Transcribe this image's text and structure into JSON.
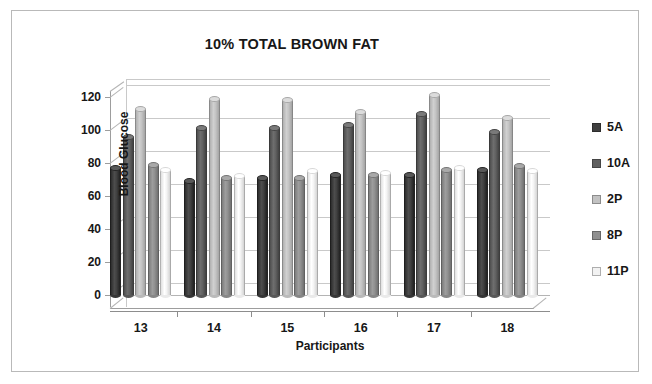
{
  "frame": {
    "border_color": "#b9b9b9",
    "background": "#ffffff"
  },
  "title": "10% TOTAL BROWN FAT",
  "axes": {
    "y_label": "Blood Glucose",
    "x_label": "Participants"
  },
  "legend": {
    "position": "right",
    "entries": [
      {
        "label": "5A",
        "color": "#3f3f3f"
      },
      {
        "label": "10A",
        "color": "#606060"
      },
      {
        "label": "2P",
        "color": "#c2c2c2"
      },
      {
        "label": "8P",
        "color": "#8f8f8f"
      },
      {
        "label": "11P",
        "color": "#f2f2f2"
      }
    ]
  },
  "chart_data": {
    "type": "bar",
    "title": "10% TOTAL BROWN FAT",
    "subtitle": "",
    "xlabel": "Participants",
    "ylabel": "Blood Glucose",
    "categories": [
      "13",
      "14",
      "15",
      "16",
      "17",
      "18"
    ],
    "ylim": [
      0,
      120
    ],
    "yticks": [
      0,
      20,
      40,
      60,
      80,
      100,
      120
    ],
    "grid": true,
    "legend_position": "right",
    "style": "3d-cylinder",
    "series": [
      {
        "name": "5A",
        "color": "#3f3f3f",
        "values": [
          77,
          69,
          71,
          73,
          73,
          76
        ]
      },
      {
        "name": "10A",
        "color": "#606060",
        "values": [
          96,
          101,
          101,
          103,
          110,
          99
        ]
      },
      {
        "name": "2P",
        "color": "#c2c2c2",
        "values": [
          113,
          119,
          118,
          111,
          121,
          107
        ]
      },
      {
        "name": "8P",
        "color": "#8f8f8f",
        "values": [
          79,
          71,
          71,
          73,
          76,
          78
        ]
      },
      {
        "name": "11P",
        "color": "#f2f2f2",
        "values": [
          76,
          72,
          75,
          74,
          77,
          75
        ]
      }
    ]
  }
}
